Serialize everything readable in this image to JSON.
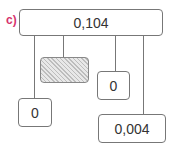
{
  "diagram": {
    "label": "c)",
    "root": {
      "value": "0,104"
    },
    "children": [
      {
        "id": "left-leaf",
        "value": "0"
      },
      {
        "id": "hatched-node",
        "value": ""
      },
      {
        "id": "middle-right-node",
        "value": "0"
      },
      {
        "id": "bottom-right-leaf",
        "value": "0,004"
      }
    ],
    "colors": {
      "label": "#d6336c",
      "border": "#777777",
      "hatch": "#bdbdbd"
    }
  }
}
